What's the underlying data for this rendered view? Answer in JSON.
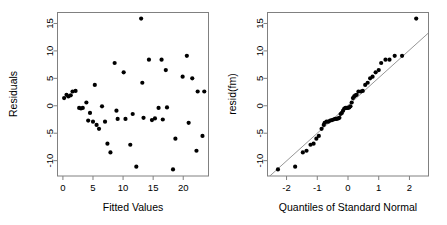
{
  "figure": {
    "background": "#ffffff",
    "point_color": "#000000",
    "frame_color": "#808080",
    "line_color": "#8a8a8a",
    "panels": 2
  },
  "chart_data": [
    {
      "type": "scatter",
      "title": "",
      "xlabel": "Fitted Values",
      "ylabel": "Residuals",
      "xlim": [
        -0.9,
        24.2
      ],
      "ylim": [
        -12.8,
        17.0
      ],
      "xticks": [
        0,
        5,
        10,
        15,
        20
      ],
      "xticklabels": [
        "0",
        "5",
        "10",
        "15",
        "20"
      ],
      "yticks": [
        -10,
        -5,
        0,
        5,
        10,
        15
      ],
      "yticklabels": [
        "-10",
        "-5",
        "0",
        "5",
        "10",
        "15"
      ],
      "grid": false,
      "legend": "none",
      "x": [
        0.2,
        0.6,
        0.9,
        1.3,
        1.6,
        2.1,
        2.7,
        3.0,
        3.3,
        3.9,
        4.2,
        4.5,
        5.0,
        5.3,
        5.6,
        6.0,
        6.5,
        7.0,
        7.4,
        7.9,
        8.6,
        8.9,
        9.1,
        10.1,
        10.4,
        11.2,
        11.6,
        12.2,
        13.0,
        13.2,
        13.4,
        14.3,
        14.8,
        15.3,
        15.9,
        16.4,
        16.6,
        17.1,
        17.3,
        18.3,
        18.7,
        19.9,
        20.6,
        20.9,
        21.5,
        22.2,
        22.4,
        23.2,
        23.5
      ],
      "y": [
        1.4,
        2.0,
        1.7,
        1.9,
        2.6,
        2.7,
        -0.4,
        -0.5,
        -0.4,
        0.6,
        -2.7,
        -1.3,
        -2.9,
        3.8,
        -3.5,
        -4.2,
        -0.1,
        -2.9,
        -6.9,
        -8.5,
        7.8,
        -0.9,
        -2.4,
        6.1,
        -2.4,
        -7.1,
        -1.5,
        -11.1,
        15.9,
        4.2,
        -2.2,
        8.4,
        -2.6,
        -2.3,
        -0.4,
        8.4,
        -2.5,
        6.5,
        -0.3,
        -11.6,
        -6.0,
        5.3,
        9.1,
        -3.1,
        5.0,
        -8.2,
        2.6,
        -5.5,
        2.6
      ]
    },
    {
      "type": "scatter",
      "title": "",
      "xlabel": "Quantiles of Standard Normal",
      "ylabel": "resid(fm)",
      "xlim": [
        -2.62,
        2.62
      ],
      "ylim": [
        -12.8,
        17.0
      ],
      "xticks": [
        -2,
        -1,
        0,
        1,
        2
      ],
      "xticklabels": [
        "-2",
        "-1",
        "0",
        "1",
        "2"
      ],
      "yticks": [
        -10,
        -5,
        0,
        5,
        10,
        15
      ],
      "yticklabels": [
        "-10",
        "-5",
        "0",
        "5",
        "10",
        "15"
      ],
      "grid": false,
      "legend": "none",
      "reference_line": {
        "slope": 5.05,
        "intercept": 0.05
      },
      "x": [
        -2.28,
        -1.72,
        -1.47,
        -1.35,
        -1.22,
        -1.12,
        -1.03,
        -0.95,
        -0.86,
        -0.79,
        -0.76,
        -0.7,
        -0.64,
        -0.58,
        -0.52,
        -0.47,
        -0.42,
        -0.37,
        -0.32,
        -0.28,
        -0.24,
        -0.2,
        -0.16,
        -0.12,
        -0.08,
        -0.04,
        0.0,
        0.04,
        0.08,
        0.12,
        0.16,
        0.2,
        0.24,
        0.28,
        0.34,
        0.42,
        0.48,
        0.56,
        0.64,
        0.72,
        0.8,
        0.9,
        1.0,
        1.08,
        1.22,
        1.35,
        1.52,
        1.76,
        2.22
      ],
      "y": [
        -11.6,
        -11.1,
        -8.5,
        -8.2,
        -7.1,
        -6.9,
        -6.0,
        -5.5,
        -4.2,
        -3.5,
        -3.1,
        -2.9,
        -2.9,
        -2.7,
        -2.6,
        -2.5,
        -2.4,
        -2.4,
        -2.3,
        -2.2,
        -1.5,
        -1.3,
        -0.9,
        -0.5,
        -0.4,
        -0.4,
        -0.4,
        -0.3,
        -0.1,
        0.6,
        1.4,
        1.7,
        1.9,
        2.0,
        2.6,
        2.6,
        2.7,
        3.8,
        4.2,
        5.0,
        5.3,
        6.1,
        6.5,
        7.8,
        8.4,
        8.4,
        9.1,
        9.1,
        15.9
      ]
    }
  ]
}
